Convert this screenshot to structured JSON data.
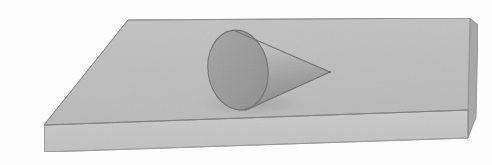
{
  "figure": {
    "background_color": "#fdfdfd",
    "ghost_watermark": "sum one\nbez pop-s"
  },
  "slab": {
    "name": "rectangular-slab",
    "top_face_color": "#bdbdbd",
    "front_face_color": "#c6c6c6",
    "right_face_color": "#a6a6a6",
    "outline_color": "#8a8a8a",
    "top_face_points": "128,20 470,18 468,110 44,125",
    "front_face_points": "44,125 468,110 468,138 44,152",
    "right_face_points": "470,18 478,24 476,116 468,138 468,110",
    "thickness_px": 27
  },
  "cone": {
    "name": "cone",
    "base_ellipse": {
      "center_x": 238,
      "center_y": 70,
      "radius_x": 30,
      "radius_y": 40,
      "rotation_deg": -8,
      "fill_color": "#9a9a9a",
      "outline_color": "#707070"
    },
    "apex_x": 330,
    "apex_y": 72,
    "lateral_light_color": "#c2c2c2",
    "lateral_mid_color": "#a8a8a8",
    "lateral_dark_color": "#8e8e8e",
    "outline_color": "#6e6e6e"
  },
  "colors": {
    "paper": "#fdfdfd",
    "light_gray": "#c6c6c6",
    "mid_gray": "#bdbdbd",
    "shadow_gray": "#a6a6a6",
    "dark_gray": "#8a8a8a",
    "line": "#6e6e6e"
  }
}
